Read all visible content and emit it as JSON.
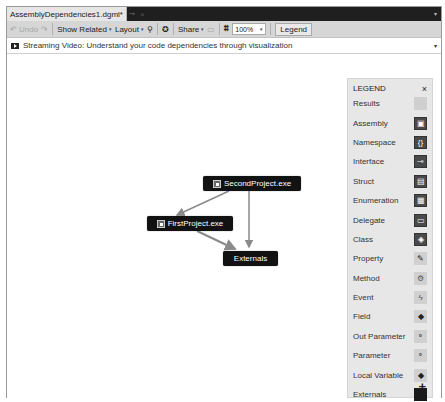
{
  "tab": {
    "title": "AssemblyDependencies1.dgml*",
    "pin_icon": "pin-icon",
    "close_icon": "×"
  },
  "toolbar": {
    "undo_label": "Undo",
    "redo_icon": "↷",
    "undo_icon": "↶",
    "show_related_label": "Show Related",
    "layout_label": "Layout",
    "share_label": "Share",
    "zoom_value": "100%",
    "legend_label": "Legend",
    "caret": "▾"
  },
  "infobar": {
    "text": "Streaming Video: Understand your code dependencies through visualization",
    "dropdown": "▾"
  },
  "graph": {
    "nodes": [
      {
        "id": "second",
        "label": "SecondProject.exe",
        "type": "Assembly"
      },
      {
        "id": "first",
        "label": "FirstProject.exe",
        "type": "Assembly"
      },
      {
        "id": "externals",
        "label": "Externals",
        "type": "Externals"
      }
    ],
    "edges": [
      {
        "from": "SecondProject.exe",
        "to": "FirstProject.exe"
      },
      {
        "from": "SecondProject.exe",
        "to": "Externals"
      },
      {
        "from": "FirstProject.exe",
        "to": "Externals"
      }
    ]
  },
  "legend": {
    "title": "LEGEND",
    "close": "×",
    "add": "+",
    "items": [
      {
        "label": "Results",
        "glyph": ""
      },
      {
        "label": "Assembly",
        "glyph": "▣"
      },
      {
        "label": "Namespace",
        "glyph": "{}"
      },
      {
        "label": "Interface",
        "glyph": "⊸"
      },
      {
        "label": "Struct",
        "glyph": "▤"
      },
      {
        "label": "Enumeration",
        "glyph": "▦"
      },
      {
        "label": "Delegate",
        "glyph": "▭"
      },
      {
        "label": "Class",
        "glyph": "◈"
      },
      {
        "label": "Property",
        "glyph": "🔧"
      },
      {
        "label": "Method",
        "glyph": "⚙"
      },
      {
        "label": "Event",
        "glyph": "ϟ"
      },
      {
        "label": "Field",
        "glyph": "◆"
      },
      {
        "label": "Out Parameter",
        "glyph": "⚬"
      },
      {
        "label": "Parameter",
        "glyph": "⚬"
      },
      {
        "label": "Local Variable",
        "glyph": "◆"
      },
      {
        "label": "Externals",
        "glyph": ""
      }
    ]
  }
}
